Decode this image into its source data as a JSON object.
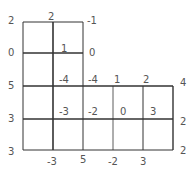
{
  "diagram": {
    "type": "grid-with-vertex-values",
    "line_color": "#333333",
    "label_color": "#555555",
    "lines": {
      "horizontal": [
        {
          "y": 22,
          "x1": 23,
          "x2": 83,
          "w": 1
        },
        {
          "y": 53,
          "x1": 23,
          "x2": 83,
          "w": 1.6
        },
        {
          "y": 86,
          "x1": 23,
          "x2": 173,
          "w": 1.6
        },
        {
          "y": 119,
          "x1": 23,
          "x2": 173,
          "w": 1.6
        },
        {
          "y": 150,
          "x1": 23,
          "x2": 173,
          "w": 1
        }
      ],
      "vertical": [
        {
          "x": 23,
          "y1": 22,
          "y2": 150,
          "w": 1
        },
        {
          "x": 53,
          "y1": 22,
          "y2": 150,
          "w": 1.6
        },
        {
          "x": 83,
          "y1": 22,
          "y2": 150,
          "w": 1
        },
        {
          "x": 113,
          "y1": 86,
          "y2": 150,
          "w": 0.8
        },
        {
          "x": 143,
          "y1": 86,
          "y2": 150,
          "w": 1
        },
        {
          "x": 173,
          "y1": 86,
          "y2": 150,
          "w": 1.4
        }
      ]
    },
    "labels": [
      {
        "id": "left-0",
        "text": "2",
        "x": 8,
        "y": 16
      },
      {
        "id": "left-1",
        "text": "0",
        "x": 8,
        "y": 48
      },
      {
        "id": "left-2",
        "text": "5",
        "x": 8,
        "y": 81
      },
      {
        "id": "left-3",
        "text": "3",
        "x": 8,
        "y": 114
      },
      {
        "id": "left-4",
        "text": "3",
        "x": 8,
        "y": 147
      },
      {
        "id": "top-mid",
        "text": "2",
        "x": 48,
        "y": 12
      },
      {
        "id": "top-right",
        "text": "-1",
        "x": 87,
        "y": 16
      },
      {
        "id": "mid-inner",
        "text": "1",
        "x": 61,
        "y": 44
      },
      {
        "id": "mid-right",
        "text": "0",
        "x": 89,
        "y": 48
      },
      {
        "id": "r86-a",
        "text": "-4",
        "x": 59,
        "y": 75
      },
      {
        "id": "r86-b",
        "text": "-4",
        "x": 88,
        "y": 75
      },
      {
        "id": "r86-c",
        "text": "1",
        "x": 114,
        "y": 75
      },
      {
        "id": "r86-d",
        "text": "2",
        "x": 143,
        "y": 75
      },
      {
        "id": "r86-e",
        "text": "4",
        "x": 180,
        "y": 78
      },
      {
        "id": "r119-a",
        "text": "-3",
        "x": 59,
        "y": 107
      },
      {
        "id": "r119-b",
        "text": "-2",
        "x": 88,
        "y": 107
      },
      {
        "id": "r119-c",
        "text": "0",
        "x": 120,
        "y": 107
      },
      {
        "id": "r119-d",
        "text": "3",
        "x": 150,
        "y": 107
      },
      {
        "id": "r119-e",
        "text": "2",
        "x": 180,
        "y": 117
      },
      {
        "id": "bottom-right",
        "text": "2",
        "x": 180,
        "y": 146
      },
      {
        "id": "bottom-a",
        "text": "-3",
        "x": 47,
        "y": 157
      },
      {
        "id": "bottom-b",
        "text": "5",
        "x": 80,
        "y": 155
      },
      {
        "id": "bottom-c",
        "text": "-2",
        "x": 108,
        "y": 157
      },
      {
        "id": "bottom-d",
        "text": "3",
        "x": 140,
        "y": 157
      }
    ]
  }
}
